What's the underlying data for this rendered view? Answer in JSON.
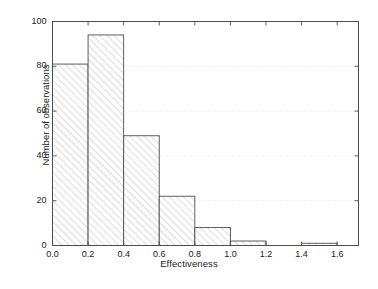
{
  "chart_data": {
    "type": "bar",
    "subtype": "histogram",
    "title": "",
    "xlabel": "Effectiveness",
    "ylabel": "Number of observations",
    "categories": [
      "0.0-0.2",
      "0.2-0.4",
      "0.4-0.6",
      "0.6-0.8",
      "0.8-1.0",
      "1.0-1.2",
      "1.2-1.4",
      "1.4-1.6"
    ],
    "bin_edges": [
      0.0,
      0.2,
      0.4,
      0.6,
      0.8,
      1.0,
      1.2,
      1.4,
      1.6
    ],
    "values": [
      81,
      94,
      49,
      22,
      8,
      2,
      0,
      1
    ],
    "bin_width": 0.2,
    "xlim": [
      0.0,
      1.72
    ],
    "ylim": [
      0,
      100
    ],
    "xticks": [
      0.0,
      0.2,
      0.4,
      0.6,
      0.8,
      1.0,
      1.2,
      1.4,
      1.6
    ],
    "xtick_labels": [
      "0.0",
      "0.2",
      "0.4",
      "0.6",
      "0.8",
      "1.0",
      "1.2",
      "1.4",
      "1.6"
    ],
    "yticks": [
      0,
      20,
      40,
      60,
      80,
      100
    ],
    "ytick_labels": [
      "0",
      "20",
      "40",
      "60",
      "80",
      "100"
    ],
    "grid": {
      "horizontal": true,
      "vertical": false,
      "style": "dotted",
      "color": "#d9d9d9"
    },
    "legend": null,
    "bar_style": {
      "fill": "hatch-diagonal",
      "hatch_color": "#b4b4b4",
      "face_color": "#ffffff",
      "edge_color": "#4d4d4d"
    },
    "frame": {
      "box": true,
      "tick_direction": "in",
      "color": "#4d4d4d"
    }
  },
  "colors": {
    "text": "#1a1a1a",
    "axis": "#4d4d4d",
    "grid": "#d9d9d9",
    "hatch": "#b4b4b4",
    "background": "#ffffff"
  }
}
